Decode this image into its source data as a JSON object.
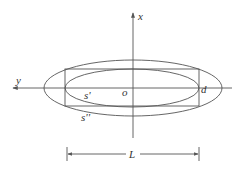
{
  "diagram": {
    "axes": {
      "horizontal_label": "y",
      "vertical_label": "x",
      "origin_label": "o"
    },
    "labels": {
      "inner_curve": "s'",
      "outer_curve": "s''",
      "end_point": "d",
      "length": "L"
    },
    "colors": {
      "stroke": "#555555",
      "text": "#333333",
      "background": "#ffffff"
    }
  }
}
